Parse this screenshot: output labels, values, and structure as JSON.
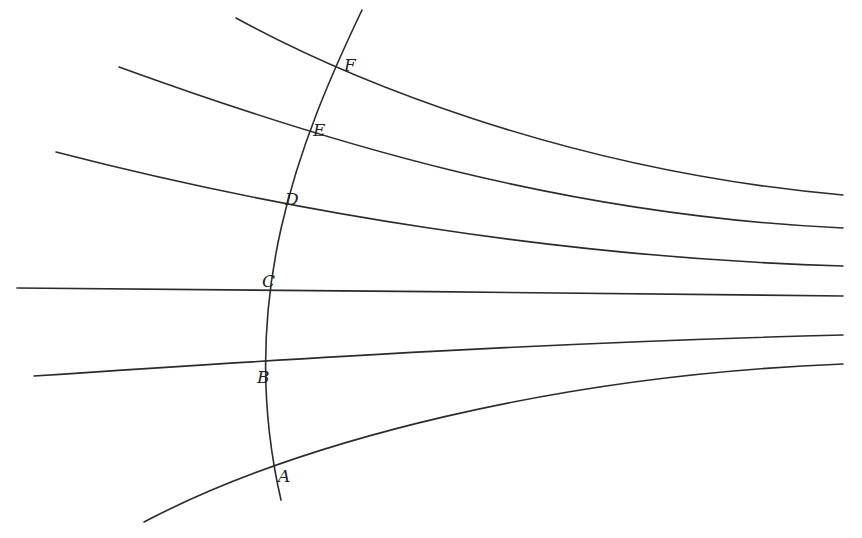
{
  "diagram": {
    "type": "geometric-field-lines",
    "stroke_color": "#2b2b2b",
    "background": "#ffffff",
    "arc": {
      "name": "crossing-arc",
      "path": "M 362 10 C 300 140, 235 300, 281 500"
    },
    "lines": [
      {
        "id": "F",
        "path": "M 236 18 C 340 75, 560 170, 843 195"
      },
      {
        "id": "E",
        "path": "M 119 67 C 320 140, 560 215, 843 228"
      },
      {
        "id": "D",
        "path": "M 56 152 C 280 210, 560 258, 843 266"
      },
      {
        "id": "C",
        "path": "M 17 288 C 300 290, 560 293, 843 296"
      },
      {
        "id": "B",
        "path": "M 34 376 C 300 358, 560 342, 843 335"
      },
      {
        "id": "A",
        "path": "M 144 522 C 300 440, 560 375, 843 364"
      }
    ],
    "points": [
      {
        "label": "F",
        "x": 344,
        "y": 71
      },
      {
        "label": "E",
        "x": 313,
        "y": 136
      },
      {
        "label": "D",
        "x": 285,
        "y": 205
      },
      {
        "label": "C",
        "x": 262,
        "y": 287
      },
      {
        "label": "B",
        "x": 257,
        "y": 383
      },
      {
        "label": "A",
        "x": 278,
        "y": 482
      }
    ]
  }
}
